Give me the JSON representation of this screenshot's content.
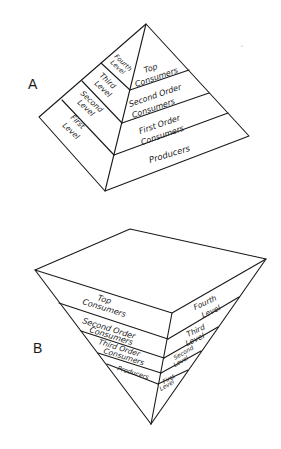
{
  "figure_a": {
    "label": "A",
    "left_face": {
      "levels": [
        {
          "line1": "Fourth",
          "line2": "Level"
        },
        {
          "line1": "Third",
          "line2": "Level"
        },
        {
          "line1": "Second",
          "line2": "Level"
        },
        {
          "line1": "First",
          "line2": "Level"
        }
      ]
    },
    "right_face": {
      "bands": [
        {
          "line1": "Top",
          "line2": "Consumers"
        },
        {
          "line1": "Second Order",
          "line2": "Consumers"
        },
        {
          "line1": "First Order",
          "line2": "Consumers"
        },
        {
          "line1": "Producers",
          "line2": ""
        }
      ]
    }
  },
  "figure_b": {
    "label": "B",
    "left_face": {
      "bands": [
        {
          "line1": "Top",
          "line2": "Consumers"
        },
        {
          "line1": "Second Order",
          "line2": "Consumers"
        },
        {
          "line1": "Third Order",
          "line2": "Consumers"
        },
        {
          "line1": "Producers",
          "line2": ""
        }
      ]
    },
    "right_face": {
      "levels": [
        {
          "line1": "Fourth",
          "line2": "Level"
        },
        {
          "line1": "Third",
          "line2": "Level"
        },
        {
          "line1": "Second",
          "line2": "Level"
        },
        {
          "line1": "First",
          "line2": "Level"
        }
      ]
    }
  }
}
